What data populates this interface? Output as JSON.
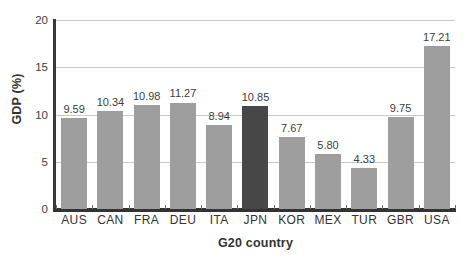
{
  "chart_data": {
    "type": "bar",
    "title": "",
    "xlabel": "G20 country",
    "ylabel": "GDP (%)",
    "categories": [
      "AUS",
      "CAN",
      "FRA",
      "DEU",
      "ITA",
      "JPN",
      "KOR",
      "MEX",
      "TUR",
      "GBR",
      "USA"
    ],
    "values": [
      9.59,
      10.34,
      10.98,
      11.27,
      8.94,
      10.85,
      7.67,
      5.8,
      4.33,
      9.75,
      17.21
    ],
    "value_labels": [
      "9.59",
      "10.34",
      "10.98",
      "11.27",
      "8.94",
      "10.85",
      "7.67",
      "5.80",
      "4.33",
      "9.75",
      "17.21"
    ],
    "highlighted_category": "JPN",
    "ylim": [
      0,
      20
    ],
    "ytick_values": [
      0,
      5,
      10,
      15,
      20
    ],
    "ytick_labels": [
      "0",
      "5",
      "10",
      "15",
      "20"
    ],
    "grid": true,
    "grid_axis": "y",
    "legend": "none",
    "colors": {
      "bar": "#9e9e9e",
      "bar_highlight": "#474747",
      "gridline": "#c9c9c9",
      "axis": "#333333",
      "text": "#333333",
      "background": "#ffffff"
    }
  }
}
